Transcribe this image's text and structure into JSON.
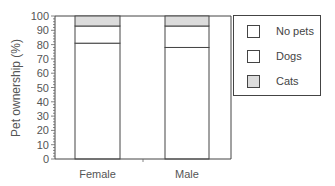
{
  "chart_data": {
    "type": "bar",
    "stacked": true,
    "title": "",
    "xlabel": "",
    "ylabel": "Pet ownership (%)",
    "ylim": [
      0,
      100
    ],
    "yticks": [
      0,
      10,
      20,
      30,
      40,
      50,
      60,
      70,
      80,
      90,
      100
    ],
    "categories": [
      "Female",
      "Male"
    ],
    "series": [
      {
        "name": "No pets",
        "values": [
          81,
          78
        ],
        "color": "#ffffff"
      },
      {
        "name": "Dogs",
        "values": [
          12,
          15
        ],
        "color": "#ffffff"
      },
      {
        "name": "Cats",
        "values": [
          7,
          7
        ],
        "color": "#dcdcdc"
      }
    ],
    "legend_position": "right",
    "grid": false
  },
  "legend": {
    "items": [
      {
        "label": "No pets",
        "color": "#ffffff"
      },
      {
        "label": "Dogs",
        "color": "#ffffff"
      },
      {
        "label": "Cats",
        "color": "#dcdcdc"
      }
    ]
  }
}
